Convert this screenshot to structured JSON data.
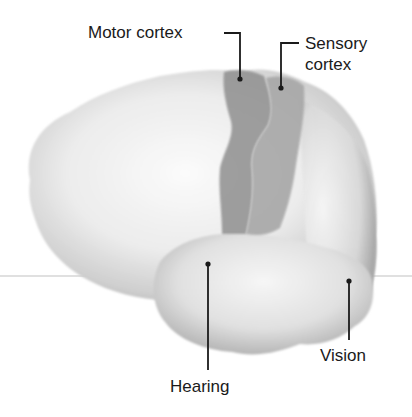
{
  "figure": {
    "type": "brain-lateral-view",
    "labels": {
      "motor": "Motor cortex",
      "sensory_line1": "Sensory",
      "sensory_line2": "cortex",
      "hearing": "Hearing",
      "vision": "Vision"
    },
    "colors": {
      "background": "#ffffff",
      "brain_light": "#f2f2f2",
      "brain_mid": "#c8c8c8",
      "brain_shadow": "#a9a9a9",
      "motor_region": "#8e8e8e",
      "sensory_region": "#a6a6a6",
      "leader_line": "#1a1a1a",
      "horizontal_rule": "#d6d6d6"
    }
  }
}
